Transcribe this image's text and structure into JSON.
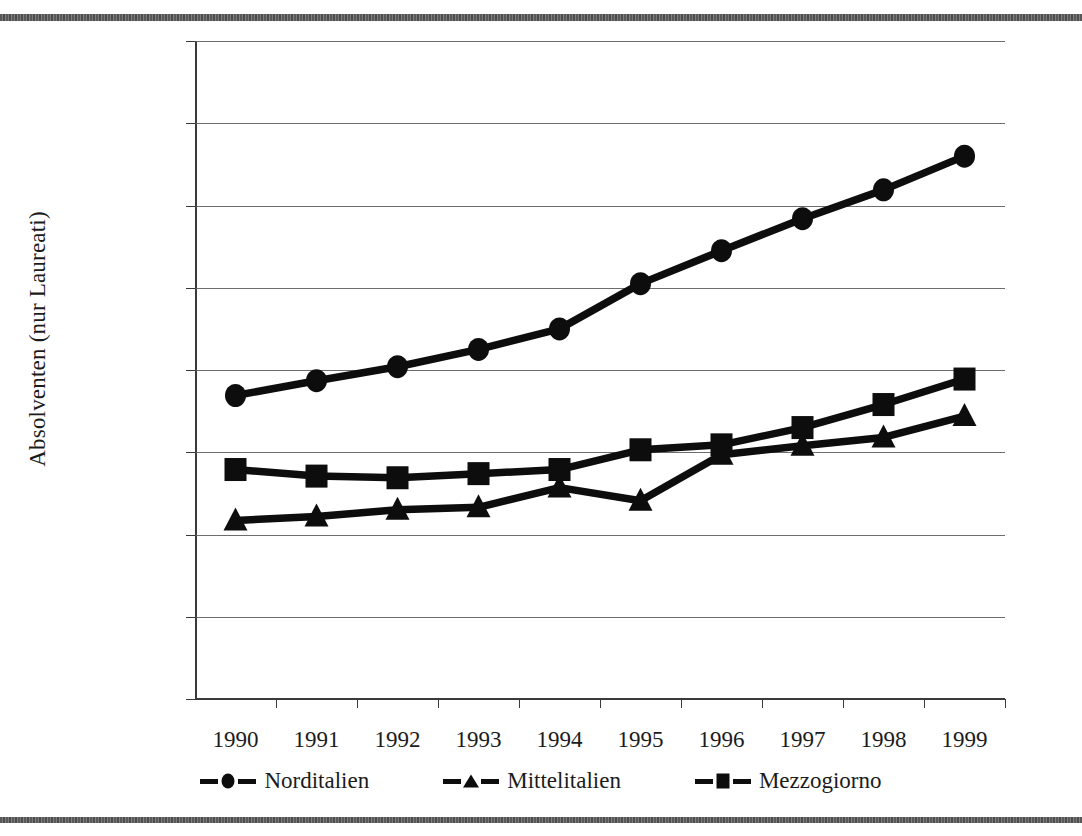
{
  "chart_data": {
    "type": "line",
    "title": "",
    "xlabel": "",
    "ylabel": "Absolventen (nur Laureati)",
    "x": [
      1990,
      1991,
      1992,
      1993,
      1994,
      1995,
      1996,
      1997,
      1998,
      1999
    ],
    "categories": [
      "1990",
      "1991",
      "1992",
      "1993",
      "1994",
      "1995",
      "1996",
      "1997",
      "1998",
      "1999"
    ],
    "ylim": [
      0,
      80000
    ],
    "ytick_labels": [
      "80.000",
      "70.000",
      "60.000",
      "50.000",
      "40.000",
      "30.000",
      "20.000",
      "10.000",
      "0"
    ],
    "ytick_values": [
      80000,
      70000,
      60000,
      50000,
      40000,
      30000,
      20000,
      10000,
      0
    ],
    "grid": true,
    "legend_position": "bottom",
    "series": [
      {
        "name": "Norditalien",
        "marker": "circle",
        "values": [
          36900,
          38700,
          40400,
          42500,
          45000,
          50500,
          54500,
          58400,
          61900,
          66000
        ]
      },
      {
        "name": "Mittelitalien",
        "marker": "triangle",
        "values": [
          21700,
          22200,
          23000,
          23300,
          25700,
          24100,
          29700,
          30800,
          31800,
          34400
        ]
      },
      {
        "name": "Mezzogiorno",
        "marker": "square",
        "values": [
          27900,
          27100,
          26900,
          27400,
          27900,
          30300,
          30900,
          33000,
          35800,
          38900
        ]
      }
    ]
  },
  "legend": {
    "items": [
      {
        "label": "Norditalien",
        "marker": "circle"
      },
      {
        "label": "Mittelitalien",
        "marker": "triangle"
      },
      {
        "label": "Mezzogiorno",
        "marker": "square"
      }
    ]
  },
  "colors": {
    "ink": "#0d0d0d",
    "gridline": "#6d6d6d",
    "axis": "#3a3a3a",
    "background": "#ffffff"
  }
}
